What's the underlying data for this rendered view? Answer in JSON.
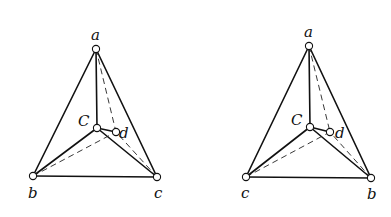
{
  "diagram": {
    "figures": [
      {
        "id": "left",
        "vertices": {
          "a": {
            "label": "a",
            "x": 96,
            "y": 49,
            "lx": 91,
            "ly": 40
          },
          "C": {
            "label": "C",
            "x": 97,
            "y": 128,
            "lx": 78,
            "ly": 126
          },
          "d": {
            "label": "d",
            "x": 116,
            "y": 132,
            "lx": 119,
            "ly": 138
          },
          "b": {
            "label": "b",
            "x": 33,
            "y": 176,
            "lx": 28,
            "ly": 198
          },
          "c": {
            "label": "c",
            "x": 157,
            "y": 177,
            "lx": 154,
            "ly": 198
          }
        }
      },
      {
        "id": "right",
        "vertices": {
          "a": {
            "label": "a",
            "x": 309,
            "y": 46,
            "lx": 304,
            "ly": 37
          },
          "C": {
            "label": "C",
            "x": 310,
            "y": 127,
            "lx": 291,
            "ly": 125
          },
          "d": {
            "label": "d",
            "x": 330,
            "y": 132,
            "lx": 335,
            "ly": 138
          },
          "c": {
            "label": "c",
            "x": 246,
            "y": 177,
            "lx": 241,
            "ly": 198
          },
          "b": {
            "label": "b",
            "x": 371,
            "y": 178,
            "lx": 367,
            "ly": 199
          }
        }
      }
    ]
  }
}
